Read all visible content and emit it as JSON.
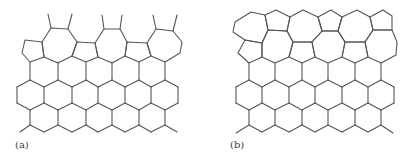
{
  "figure": {
    "stroke_color": "#555555",
    "stroke_width": 1.1,
    "panels": [
      {
        "label": "(a)",
        "polygons": [
          [
            [
              42,
              42
            ],
            [
              25,
              40
            ],
            [
              22,
              53
            ],
            [
              30,
              62
            ],
            [
              44,
              57
            ]
          ],
          [
            [
              51,
              28
            ],
            [
              68,
              29
            ],
            [
              77,
              42
            ],
            [
              72,
              56
            ],
            [
              58,
              63
            ],
            [
              44,
              57
            ],
            [
              42,
              42
            ]
          ],
          [
            [
              77,
              42
            ],
            [
              95,
              43
            ],
            [
              98,
              57
            ],
            [
              86,
              62
            ],
            [
              72,
              56
            ]
          ],
          [
            [
              104,
              29
            ],
            [
              120,
              29
            ],
            [
              127,
              42
            ],
            [
              125,
              56
            ],
            [
              112,
              63
            ],
            [
              98,
              57
            ],
            [
              95,
              43
            ]
          ],
          [
            [
              127,
              42
            ],
            [
              147,
              43
            ],
            [
              151,
              56
            ],
            [
              139,
              62
            ],
            [
              125,
              56
            ]
          ],
          [
            [
              156,
              29
            ],
            [
              173,
              31
            ],
            [
              182,
              42
            ],
            [
              180,
              53
            ],
            [
              165,
              62
            ],
            [
              151,
              56
            ],
            [
              147,
              43
            ]
          ]
        ],
        "segments": [
          [
            [
              48,
              14
            ],
            [
              51,
              28
            ]
          ],
          [
            [
              72,
              14
            ],
            [
              68,
              29
            ]
          ],
          [
            [
              102,
              15
            ],
            [
              104,
              29
            ]
          ],
          [
            [
              122,
              15
            ],
            [
              120,
              29
            ]
          ],
          [
            [
              153,
              15
            ],
            [
              156,
              29
            ]
          ],
          [
            [
              177,
              15
            ],
            [
              173,
              31
            ]
          ]
        ],
        "hex": {
          "even_x": [
            30,
            58,
            86,
            112,
            139,
            165
          ],
          "odd_x": [
            17,
            44,
            72,
            98,
            125,
            151,
            178
          ],
          "y_top": 62,
          "y1": 80,
          "y2": 87,
          "y3": 103,
          "y4": 110,
          "y5": 125,
          "y6": 132,
          "tail_left": [
            [
              30,
              125
            ],
            [
              20,
              132
            ]
          ],
          "tail_right": [
            [
              165,
              125
            ],
            [
              177,
              132
            ]
          ]
        }
      },
      {
        "label": "(b)",
        "polygons": [
          [
            [
              235,
              22
            ],
            [
              251,
              12
            ],
            [
              265,
              15
            ],
            [
              268,
              30
            ],
            [
              262,
              43
            ],
            [
              245,
              40
            ],
            [
              233,
              32
            ]
          ],
          [
            [
              265,
              15
            ],
            [
              276,
              10
            ],
            [
              290,
              17
            ],
            [
              287,
              31
            ],
            [
              268,
              30
            ]
          ],
          [
            [
              290,
              17
            ],
            [
              303,
              10
            ],
            [
              318,
              17
            ],
            [
              322,
              31
            ],
            [
              312,
              42
            ],
            [
              293,
              42
            ],
            [
              287,
              31
            ]
          ],
          [
            [
              318,
              17
            ],
            [
              331,
              10
            ],
            [
              342,
              17
            ],
            [
              338,
              31
            ],
            [
              322,
              31
            ]
          ],
          [
            [
              342,
              17
            ],
            [
              357,
              10
            ],
            [
              370,
              17
            ],
            [
              373,
              30
            ],
            [
              365,
              42
            ],
            [
              345,
              42
            ],
            [
              338,
              31
            ]
          ],
          [
            [
              370,
              17
            ],
            [
              383,
              10
            ],
            [
              392,
              16
            ],
            [
              392,
              30
            ],
            [
              373,
              30
            ]
          ],
          [
            [
              373,
              30
            ],
            [
              392,
              30
            ],
            [
              397,
              42
            ],
            [
              396,
              55
            ],
            [
              381,
              63
            ],
            [
              368,
              57
            ],
            [
              365,
              42
            ]
          ],
          [
            [
              245,
              40
            ],
            [
              262,
              43
            ],
            [
              262,
              57
            ],
            [
              249,
              63
            ],
            [
              238,
              53
            ]
          ],
          [
            [
              262,
              43
            ],
            [
              268,
              30
            ],
            [
              287,
              31
            ],
            [
              293,
              42
            ],
            [
              289,
              57
            ],
            [
              275,
              63
            ],
            [
              262,
              57
            ]
          ],
          [
            [
              293,
              42
            ],
            [
              312,
              42
            ],
            [
              315,
              57
            ],
            [
              302,
              63
            ],
            [
              289,
              57
            ]
          ],
          [
            [
              312,
              42
            ],
            [
              322,
              31
            ],
            [
              338,
              31
            ],
            [
              345,
              42
            ],
            [
              342,
              57
            ],
            [
              328,
              63
            ],
            [
              315,
              57
            ]
          ],
          [
            [
              345,
              42
            ],
            [
              365,
              42
            ],
            [
              368,
              57
            ],
            [
              355,
              63
            ],
            [
              342,
              57
            ]
          ]
        ],
        "segments": [],
        "hex": {
          "even_x": [
            249,
            275,
            302,
            328,
            355,
            381
          ],
          "odd_x": [
            236,
            262,
            289,
            315,
            342,
            368,
            394
          ],
          "y_top": 63,
          "y1": 80,
          "y2": 87,
          "y3": 103,
          "y4": 110,
          "y5": 125,
          "y6": 132,
          "tail_left": [
            [
              249,
              125
            ],
            [
              236,
              133
            ]
          ],
          "tail_right": [
            [
              381,
              125
            ],
            [
              393,
              133
            ]
          ]
        }
      }
    ]
  }
}
